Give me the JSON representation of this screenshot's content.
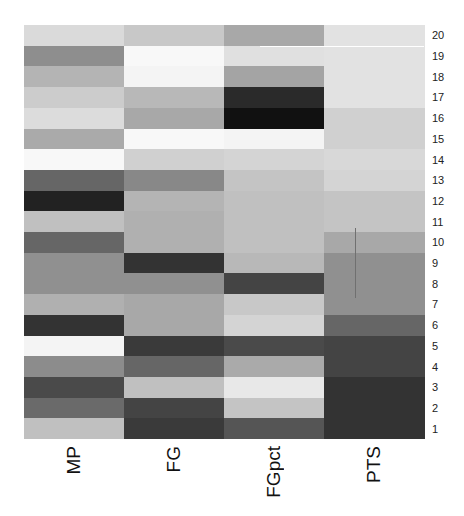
{
  "chart_data": {
    "type": "heatmap",
    "title": "",
    "xlabel": "",
    "ylabel": "",
    "colormap": "grayscale (dark = high intensity, light = low)",
    "columns": [
      "MP",
      "FG",
      "FGpct",
      "PTS"
    ],
    "rows": [
      "20",
      "19",
      "18",
      "17",
      "16",
      "15",
      "14",
      "13",
      "12",
      "11",
      "10",
      "9",
      "8",
      "7",
      "6",
      "5",
      "4",
      "3",
      "2",
      "1"
    ],
    "cell_colors": [
      [
        "#dadada",
        "#c8c8c8",
        "#a8a8a8",
        "#e2e2e2"
      ],
      [
        "#8e8e8e",
        "#f8f8f8",
        "#e0e0e0",
        "#e2e2e2"
      ],
      [
        "#b4b4b4",
        "#f4f4f4",
        "#a4a4a4",
        "#e2e2e2"
      ],
      [
        "#cccccc",
        "#b8b8b8",
        "#2a2a2a",
        "#e2e2e2"
      ],
      [
        "#dcdcdc",
        "#a8a8a8",
        "#111111",
        "#d0d0d0"
      ],
      [
        "#aaaaaa",
        "#f8f8f8",
        "#f4f4f4",
        "#d0d0d0"
      ],
      [
        "#f8f8f8",
        "#d0d0d0",
        "#d4d4d4",
        "#d8d8d8"
      ],
      [
        "#666666",
        "#888888",
        "#c4c4c4",
        "#d4d4d4"
      ],
      [
        "#222222",
        "#b4b4b4",
        "#c0c0c0",
        "#c4c4c4"
      ],
      [
        "#c0c0c0",
        "#b0b0b0",
        "#c0c0c0",
        "#c4c4c4"
      ],
      [
        "#666666",
        "#b0b0b0",
        "#c0c0c0",
        "#a8a8a8"
      ],
      [
        "#909090",
        "#333333",
        "#b8b8b8",
        "#909090"
      ],
      [
        "#909090",
        "#909090",
        "#444444",
        "#909090"
      ],
      [
        "#b0b0b0",
        "#a8a8a8",
        "#c8c8c8",
        "#909090"
      ],
      [
        "#333333",
        "#a8a8a8",
        "#d4d4d4",
        "#666666"
      ],
      [
        "#f4f4f4",
        "#3a3a3a",
        "#4a4a4a",
        "#444444"
      ],
      [
        "#8c8c8c",
        "#666666",
        "#aaaaaa",
        "#444444"
      ],
      [
        "#4a4a4a",
        "#c0c0c0",
        "#e8e8e8",
        "#333333"
      ],
      [
        "#6a6a6a",
        "#444444",
        "#c4c4c4",
        "#333333"
      ],
      [
        "#c0c0c0",
        "#3a3a3a",
        "#555555",
        "#333333"
      ]
    ],
    "legend": null,
    "grid": false
  },
  "labels": {
    "columns": [
      "MP",
      "FG",
      "FGpct",
      "PTS"
    ],
    "rows": [
      "20",
      "19",
      "18",
      "17",
      "16",
      "15",
      "14",
      "13",
      "12",
      "11",
      "10",
      "9",
      "8",
      "7",
      "6",
      "5",
      "4",
      "3",
      "2",
      "1"
    ]
  }
}
